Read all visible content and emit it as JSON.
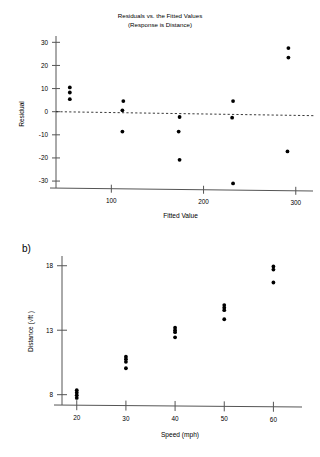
{
  "figure": {
    "panel_a_label": "",
    "panel_b_label": "b)"
  },
  "chart_data": [
    {
      "id": "residual-plot",
      "type": "scatter",
      "title": "Residuals vs. the Fitted Values",
      "subtitle": "(Response is Distance)",
      "xlabel": "Fitted Value",
      "ylabel": "Residual",
      "xlim": [
        40,
        310
      ],
      "ylim": [
        -33,
        31
      ],
      "xticks": [
        100,
        200,
        300
      ],
      "xtick_labels": [
        "100",
        "200",
        "300"
      ],
      "yticks": [
        -30,
        -20,
        -10,
        0,
        10,
        20,
        30
      ],
      "ytick_labels": [
        "-30",
        "-20",
        "-10",
        "0",
        "10",
        "20",
        "30"
      ],
      "grid": false,
      "legend": "none",
      "reference_line": {
        "type": "horizontal-dashed",
        "y": 0
      },
      "points": [
        {
          "x": 55,
          "y": 10.5
        },
        {
          "x": 55,
          "y": 8.3
        },
        {
          "x": 55,
          "y": 5.4
        },
        {
          "x": 113,
          "y": 4.6
        },
        {
          "x": 112,
          "y": 0.6
        },
        {
          "x": 112,
          "y": -8.6
        },
        {
          "x": 174,
          "y": -2.3
        },
        {
          "x": 173,
          "y": -8.6
        },
        {
          "x": 174,
          "y": -20.8
        },
        {
          "x": 232,
          "y": 4.6
        },
        {
          "x": 231,
          "y": -2.6
        },
        {
          "x": 232,
          "y": -31.0
        },
        {
          "x": 292,
          "y": 27.5
        },
        {
          "x": 292,
          "y": 23.4
        },
        {
          "x": 291,
          "y": -17.2
        }
      ]
    },
    {
      "id": "distance-vs-speed",
      "type": "scatter",
      "title": "",
      "xlabel": "Speed (mph)",
      "ylabel": "Distance (√ft )",
      "xlim": [
        17,
        65
      ],
      "ylim": [
        7.2,
        18.6
      ],
      "xticks": [
        20,
        30,
        40,
        50,
        60
      ],
      "xtick_labels": [
        "20",
        "30",
        "40",
        "50",
        "60"
      ],
      "yticks": [
        8,
        13,
        18
      ],
      "ytick_labels": [
        "8",
        "13",
        "18"
      ],
      "grid": false,
      "legend": "none",
      "points": [
        {
          "x": 20,
          "y": 8.35
        },
        {
          "x": 20,
          "y": 8.15
        },
        {
          "x": 20,
          "y": 7.95
        },
        {
          "x": 20,
          "y": 7.75
        },
        {
          "x": 30,
          "y": 10.95
        },
        {
          "x": 30,
          "y": 10.75
        },
        {
          "x": 30,
          "y": 10.55
        },
        {
          "x": 30,
          "y": 10.05
        },
        {
          "x": 40,
          "y": 13.2
        },
        {
          "x": 40,
          "y": 13.0
        },
        {
          "x": 40,
          "y": 12.85
        },
        {
          "x": 40,
          "y": 12.45
        },
        {
          "x": 50,
          "y": 14.95
        },
        {
          "x": 50,
          "y": 14.75
        },
        {
          "x": 50,
          "y": 14.55
        },
        {
          "x": 50,
          "y": 13.85
        },
        {
          "x": 60,
          "y": 17.95
        },
        {
          "x": 60,
          "y": 17.7
        },
        {
          "x": 60,
          "y": 16.7
        }
      ]
    }
  ]
}
